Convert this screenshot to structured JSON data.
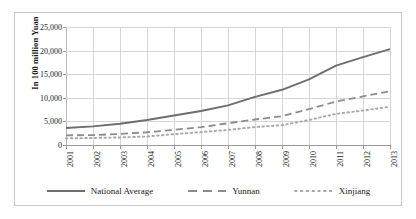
{
  "chart_data": {
    "type": "line",
    "title": "",
    "xlabel": "",
    "ylabel": "In 100 million Yuan",
    "categories": [
      "2001",
      "2002",
      "2003",
      "2004",
      "2005",
      "2006",
      "2007",
      "2008",
      "2009",
      "2010",
      "2011",
      "2012",
      "2013"
    ],
    "x": [
      2001,
      2002,
      2003,
      2004,
      2005,
      2006,
      2007,
      2008,
      2009,
      2010,
      2011,
      2012,
      2013
    ],
    "ylim": [
      0,
      25000
    ],
    "xlim": [
      2001,
      2013
    ],
    "ytick_labels": [
      "25,000",
      "20,000",
      "15,000",
      "10,000",
      "5,000",
      "0"
    ],
    "ytick_values": [
      25000,
      20000,
      15000,
      10000,
      5000,
      0
    ],
    "grid": true,
    "legend_position": "bottom",
    "series": [
      {
        "name": "National Average",
        "style": "solid",
        "color": "#6e6e6e",
        "values": [
          3600,
          3950,
          4500,
          5300,
          6250,
          7200,
          8400,
          10200,
          11700,
          13900,
          16800,
          18600,
          20300
        ]
      },
      {
        "name": "Yunnan",
        "style": "dashed",
        "color": "#8c8c8c",
        "values": [
          2050,
          2100,
          2350,
          2700,
          3200,
          3800,
          4600,
          5400,
          6100,
          7600,
          9200,
          10300,
          11400
        ]
      },
      {
        "name": "Xinjiang",
        "style": "dotted",
        "color": "#a8a8a8",
        "values": [
          1400,
          1500,
          1600,
          1800,
          2300,
          2750,
          3200,
          3800,
          4200,
          5300,
          6600,
          7300,
          8100
        ]
      }
    ]
  },
  "legend": {
    "items": [
      {
        "label": "National Average",
        "style": "solid"
      },
      {
        "label": "Yunnan",
        "style": "dashed"
      },
      {
        "label": "Xinjiang",
        "style": "dotted"
      }
    ]
  }
}
